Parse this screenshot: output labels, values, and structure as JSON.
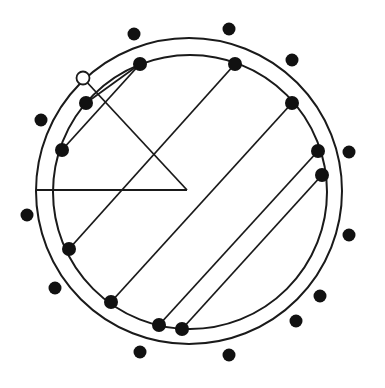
{
  "diagram": {
    "width": 385,
    "height": 388,
    "stroke_color": "#1a1a1a",
    "dot_color": "#111111",
    "background": "#ffffff",
    "circles": [
      {
        "name": "outer-circle",
        "cx": 189,
        "cy": 191,
        "r": 153
      },
      {
        "name": "inner-circle",
        "cx": 190,
        "cy": 192,
        "r": 137
      }
    ],
    "inner_dots": [
      [
        140,
        64
      ],
      [
        235,
        64
      ],
      [
        292,
        103
      ],
      [
        318,
        151
      ],
      [
        322,
        175
      ],
      [
        86,
        103
      ],
      [
        62,
        150
      ],
      [
        69,
        249
      ],
      [
        111,
        302
      ],
      [
        159,
        325
      ],
      [
        182,
        329
      ]
    ],
    "outer_dots": [
      [
        134,
        34
      ],
      [
        229,
        29
      ],
      [
        292,
        60
      ],
      [
        349,
        152
      ],
      [
        41,
        120
      ],
      [
        27,
        215
      ],
      [
        349,
        235
      ],
      [
        55,
        288
      ],
      [
        320,
        296
      ],
      [
        296,
        321
      ],
      [
        140,
        352
      ],
      [
        229,
        355
      ]
    ],
    "open_circle": [
      83,
      78
    ],
    "chords": [
      [
        235,
        64,
        69,
        249
      ],
      [
        292,
        103,
        111,
        302
      ],
      [
        318,
        151,
        159,
        325
      ],
      [
        322,
        175,
        182,
        329
      ],
      [
        140,
        64,
        86,
        103
      ],
      [
        140,
        64,
        62,
        150
      ]
    ],
    "triangle_lines": [
      [
        83,
        78,
        187,
        190
      ],
      [
        37,
        190,
        187,
        190
      ]
    ]
  }
}
